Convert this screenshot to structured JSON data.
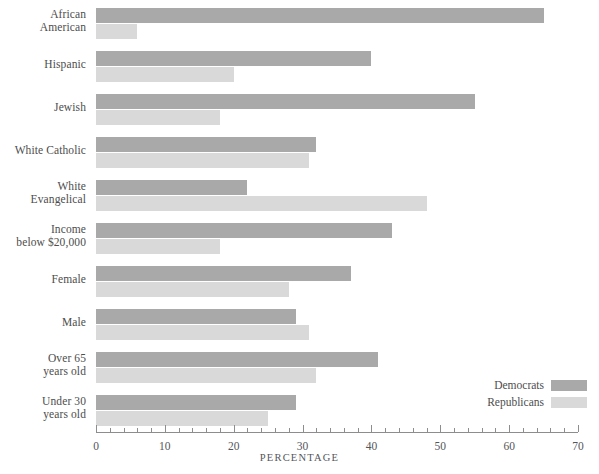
{
  "chart_data": {
    "type": "bar",
    "orientation": "horizontal",
    "title": "",
    "xlabel": "PERCENTAGE",
    "ylabel": "",
    "xlim": [
      0,
      70
    ],
    "xticks": [
      0,
      10,
      20,
      30,
      40,
      50,
      60,
      70
    ],
    "xtick_labels": [
      "0",
      "10",
      "20",
      "30",
      "40",
      "50",
      "60",
      "70"
    ],
    "minor_tick_step": 2,
    "grid": false,
    "legend_position": "bottom-right",
    "categories": [
      "African American",
      "Hispanic",
      "Jewish",
      "White Catholic",
      "White Evangelical",
      "Income below $20,000",
      "Female",
      "Male",
      "Over 65 years old",
      "Under 30 years old"
    ],
    "category_lines": [
      [
        "African",
        "American"
      ],
      [
        "Hispanic",
        ""
      ],
      [
        "Jewish",
        ""
      ],
      [
        "White Catholic",
        ""
      ],
      [
        "White",
        "Evangelical"
      ],
      [
        "Income",
        "below $20,000"
      ],
      [
        "Female",
        ""
      ],
      [
        "Male",
        ""
      ],
      [
        "Over 65",
        "years old"
      ],
      [
        "Under 30",
        "years old"
      ]
    ],
    "series": [
      {
        "name": "Democrats",
        "color": "#a9a9a9",
        "values": [
          65,
          40,
          55,
          32,
          22,
          43,
          37,
          29,
          41,
          29
        ]
      },
      {
        "name": "Republicans",
        "color": "#d9d9d9",
        "values": [
          6,
          20,
          18,
          31,
          48,
          18,
          28,
          31,
          32,
          25
        ]
      }
    ]
  },
  "legend": {
    "items": [
      {
        "label": "Democrats",
        "color": "#a9a9a9"
      },
      {
        "label": "Republicans",
        "color": "#d9d9d9"
      }
    ]
  },
  "axis": {
    "title": "PERCENTAGE",
    "labels": [
      "0",
      "10",
      "20",
      "30",
      "40",
      "50",
      "60",
      "70"
    ]
  }
}
